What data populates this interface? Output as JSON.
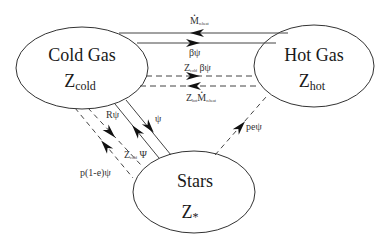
{
  "diagram": {
    "nodes": [
      {
        "id": "cold_gas",
        "title": "Cold Gas",
        "metal_symbol": "Z",
        "metal_sub": "cold"
      },
      {
        "id": "hot_gas",
        "title": "Hot Gas",
        "metal_symbol": "Z",
        "metal_sub": "hot"
      },
      {
        "id": "stars",
        "title": "Stars",
        "metal_symbol": "Z",
        "metal_sub": "*"
      }
    ],
    "flows": [
      {
        "id": "reheat",
        "from": "hot_gas",
        "to": "cold_gas",
        "style": "solid",
        "label_main": "M",
        "label_sub": "reheat",
        "dot": true
      },
      {
        "id": "beta_psi",
        "from": "cold_gas",
        "to": "hot_gas",
        "style": "solid",
        "label": "βψ"
      },
      {
        "id": "z_cold_beta_psi",
        "from": "cold_gas",
        "to": "hot_gas",
        "style": "dashed",
        "label_pre": "Z",
        "label_pre_sub": "cold",
        "label": "βψ"
      },
      {
        "id": "z_hot_reheat",
        "from": "hot_gas",
        "to": "cold_gas",
        "style": "dashed",
        "label_pre": "Z",
        "label_pre_sub": "hot",
        "label_main": "M",
        "label_sub": "reheat",
        "dot": true
      },
      {
        "id": "psi",
        "from": "cold_gas",
        "to": "stars",
        "style": "solid",
        "label": "ψ"
      },
      {
        "id": "r_psi",
        "from": "stars",
        "to": "cold_gas",
        "style": "solid",
        "label": "Rψ"
      },
      {
        "id": "z_cold_psi",
        "from": "cold_gas",
        "to": "stars",
        "style": "dashed",
        "label_pre": "Z",
        "label_pre_sub": "cold",
        "label": "Ψ"
      },
      {
        "id": "p_1_e_psi",
        "from": "stars",
        "to": "cold_gas",
        "style": "dashed",
        "label": "p(1-e)ψ"
      },
      {
        "id": "pe_psi",
        "from": "stars",
        "to": "hot_gas",
        "style": "dashed",
        "label": "peψ"
      }
    ]
  }
}
